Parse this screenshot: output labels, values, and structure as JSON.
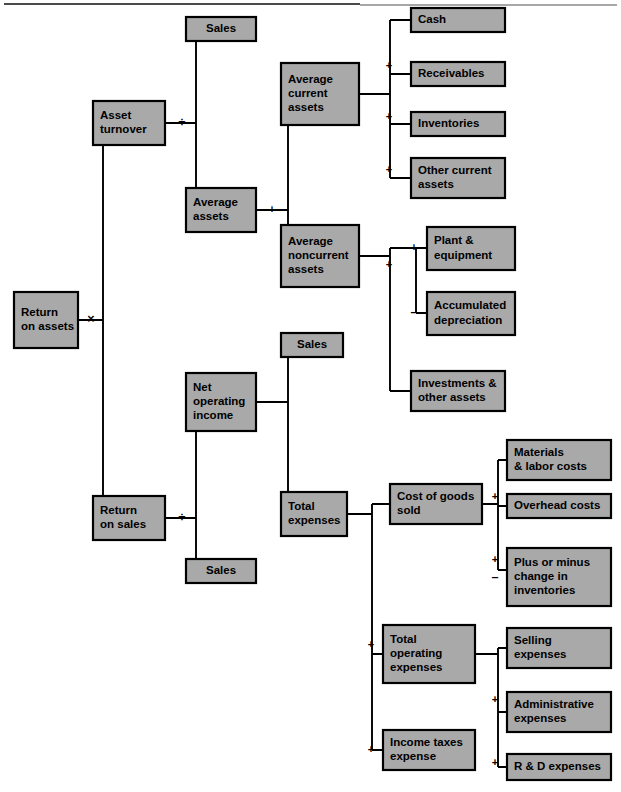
{
  "page": {
    "width": 621,
    "height": 792,
    "background_color": "#ffffff",
    "node_fill_color": "#a9a9a9",
    "node_border_color": "#000000",
    "connector_color": "#000000",
    "top_rule_color": "#8a8a8a"
  },
  "diagram": {
    "type": "tree",
    "root": "Return on assets",
    "nodes": [
      {
        "id": "return-on-assets",
        "label": "Return\non assets",
        "x": 14,
        "y": 292,
        "w": 64,
        "h": 56,
        "align": "left"
      },
      {
        "id": "asset-turnover",
        "label": "Asset\nturnover",
        "x": 93,
        "y": 101,
        "w": 72,
        "h": 44,
        "align": "left"
      },
      {
        "id": "return-on-sales",
        "label": "Return\non sales",
        "x": 93,
        "y": 496,
        "w": 72,
        "h": 44,
        "align": "left"
      },
      {
        "id": "sales-top",
        "label": "Sales",
        "x": 186,
        "y": 17,
        "w": 70,
        "h": 24,
        "align": "center"
      },
      {
        "id": "average-assets",
        "label": "Average\nassets",
        "x": 186,
        "y": 188,
        "w": 70,
        "h": 44,
        "align": "left"
      },
      {
        "id": "net-operating-income",
        "label": "Net\noperating\nincome",
        "x": 186,
        "y": 373,
        "w": 70,
        "h": 58,
        "align": "left"
      },
      {
        "id": "sales-bottom",
        "label": "Sales",
        "x": 186,
        "y": 559,
        "w": 70,
        "h": 24,
        "align": "center"
      },
      {
        "id": "average-current-assets",
        "label": "Average\ncurrent\nassets",
        "x": 281,
        "y": 63,
        "w": 78,
        "h": 62,
        "align": "left"
      },
      {
        "id": "average-noncurrent-assets",
        "label": "Average\nnoncurrent\nassets",
        "x": 281,
        "y": 225,
        "w": 78,
        "h": 62,
        "align": "left"
      },
      {
        "id": "sales-mid",
        "label": "Sales",
        "x": 281,
        "y": 333,
        "w": 62,
        "h": 24,
        "align": "center"
      },
      {
        "id": "total-expenses",
        "label": "Total\nexpenses",
        "x": 281,
        "y": 492,
        "w": 66,
        "h": 44,
        "align": "left"
      },
      {
        "id": "cash",
        "label": "Cash",
        "x": 411,
        "y": 8,
        "w": 94,
        "h": 24,
        "align": "left"
      },
      {
        "id": "receivables",
        "label": "Receivables",
        "x": 411,
        "y": 62,
        "w": 94,
        "h": 24,
        "align": "left"
      },
      {
        "id": "inventories",
        "label": "Inventories",
        "x": 411,
        "y": 112,
        "w": 94,
        "h": 24,
        "align": "left"
      },
      {
        "id": "other-current-assets",
        "label": "Other current\nassets",
        "x": 411,
        "y": 158,
        "w": 94,
        "h": 40,
        "align": "left"
      },
      {
        "id": "plant-equipment",
        "label": "Plant &\nequipment",
        "x": 427,
        "y": 227,
        "w": 88,
        "h": 43,
        "align": "left"
      },
      {
        "id": "accumulated-depreciation",
        "label": "Accumulated\ndepreciation",
        "x": 427,
        "y": 292,
        "w": 88,
        "h": 43,
        "align": "left"
      },
      {
        "id": "investments-other-assets",
        "label": "Investments &\nother assets",
        "x": 411,
        "y": 371,
        "w": 94,
        "h": 40,
        "align": "left"
      },
      {
        "id": "cost-of-goods-sold",
        "label": "Cost of goods\nsold",
        "x": 390,
        "y": 484,
        "w": 92,
        "h": 40,
        "align": "left"
      },
      {
        "id": "total-operating-expenses",
        "label": "Total\noperating\nexpenses",
        "x": 383,
        "y": 625,
        "w": 92,
        "h": 58,
        "align": "left"
      },
      {
        "id": "income-taxes-expense",
        "label": "Income taxes\nexpense",
        "x": 383,
        "y": 730,
        "w": 92,
        "h": 40,
        "align": "left"
      },
      {
        "id": "materials-labor-costs",
        "label": "Materials\n& labor costs",
        "x": 507,
        "y": 440,
        "w": 104,
        "h": 40,
        "align": "left"
      },
      {
        "id": "overhead-costs",
        "label": "Overhead costs",
        "x": 507,
        "y": 494,
        "w": 104,
        "h": 24,
        "align": "left"
      },
      {
        "id": "plus-or-minus-change",
        "label": "Plus or minus\nchange in\ninventories",
        "x": 507,
        "y": 548,
        "w": 104,
        "h": 58,
        "align": "left"
      },
      {
        "id": "selling-expenses",
        "label": "Selling\nexpenses",
        "x": 507,
        "y": 628,
        "w": 104,
        "h": 40,
        "align": "left"
      },
      {
        "id": "administrative-expenses",
        "label": "Administrative\nexpenses",
        "x": 507,
        "y": 692,
        "w": 104,
        "h": 40,
        "align": "left"
      },
      {
        "id": "r-and-d-expenses",
        "label": "R & D expenses",
        "x": 507,
        "y": 754,
        "w": 104,
        "h": 26,
        "align": "left"
      }
    ],
    "operators": [
      {
        "id": "op-multiply-roa",
        "symbol": "×",
        "x": 91,
        "y": 320,
        "size": "big"
      },
      {
        "id": "op-divide-asset-turn",
        "symbol": "÷",
        "x": 182,
        "y": 123,
        "size": "big"
      },
      {
        "id": "op-divide-ros",
        "symbol": "÷",
        "x": 182,
        "y": 518,
        "size": "big"
      },
      {
        "id": "op-plus-avg-assets",
        "symbol": "+",
        "x": 272,
        "y": 210,
        "size": "small"
      },
      {
        "id": "op-minus-noi",
        "symbol": "–",
        "x": 272,
        "y": 402,
        "size": "big"
      },
      {
        "id": "op-plus-cash-recv",
        "symbol": "+",
        "x": 389,
        "y": 66,
        "size": "small"
      },
      {
        "id": "op-plus-recv-inv",
        "symbol": "+",
        "x": 389,
        "y": 117,
        "size": "small"
      },
      {
        "id": "op-plus-inv-other",
        "symbol": "+",
        "x": 389,
        "y": 170,
        "size": "small"
      },
      {
        "id": "op-plus-plant",
        "symbol": "+",
        "x": 414,
        "y": 248,
        "size": "small"
      },
      {
        "id": "op-minus-accum-depr",
        "symbol": "–",
        "x": 414,
        "y": 313,
        "size": "big"
      },
      {
        "id": "op-plus-investments",
        "symbol": "+",
        "x": 389,
        "y": 265,
        "size": "small"
      },
      {
        "id": "op-plus-overhead",
        "symbol": "+",
        "x": 495,
        "y": 497,
        "size": "small"
      },
      {
        "id": "op-plus-change-inv",
        "symbol": "+",
        "x": 495,
        "y": 560,
        "size": "small"
      },
      {
        "id": "op-minus-change-inv",
        "symbol": "–",
        "x": 495,
        "y": 578,
        "size": "big"
      },
      {
        "id": "op-plus-total-oper-exp",
        "symbol": "+",
        "x": 371,
        "y": 645,
        "size": "small"
      },
      {
        "id": "op-plus-income-taxes",
        "symbol": "+",
        "x": 371,
        "y": 750,
        "size": "small"
      },
      {
        "id": "op-plus-admin-exp",
        "symbol": "+",
        "x": 495,
        "y": 700,
        "size": "small"
      },
      {
        "id": "op-plus-rnd-exp",
        "symbol": "+",
        "x": 495,
        "y": 763,
        "size": "small"
      }
    ],
    "connectors": [
      {
        "id": "conn-roa-split",
        "d": "M 78 320 L 103 320 M 103 320 L 103 123 M 103 320 L 103 518 M 103 123 L 93 123 M 103 518 L 93 518"
      },
      {
        "id": "conn-asset-turnover",
        "d": "M 165 123 L 196 123 M 196 123 L 196 29 M 196 123 L 196 210 M 196 29 L 186 29 M 196 210 L 186 210"
      },
      {
        "id": "conn-ros",
        "d": "M 165 518 L 196 518 M 196 518 L 196 402 M 196 518 L 196 571 M 196 402 L 186 402 M 196 571 L 186 571"
      },
      {
        "id": "conn-avg-assets",
        "d": "M 256 210 L 288 210 M 288 210 L 288 94 M 288 210 L 288 256 M 288 94 L 281 94 M 288 256 L 281 256"
      },
      {
        "id": "conn-noi",
        "d": "M 256 402 L 288 402 M 288 402 L 288 345 M 288 402 L 288 514 M 288 345 L 281 345 M 288 514 L 281 514"
      },
      {
        "id": "conn-avg-current",
        "d": "M 359 94 L 390 94 M 390 94 L 390 20 M 390 94 L 390 178 M 390 20 L 411 20 M 390 74 L 411 74 M 390 124 L 411 124 M 390 178 L 411 178"
      },
      {
        "id": "conn-avg-noncurrent",
        "d": "M 359 256 L 390 256 M 390 256 L 390 248 M 390 256 L 390 391 M 390 391 L 411 391 M 390 248 L 416 248 M 416 248 L 416 313 M 416 248 L 427 248 M 416 313 L 427 313"
      },
      {
        "id": "conn-total-expenses",
        "d": "M 347 514 L 372 514 M 372 514 L 372 504 M 372 514 L 372 654 M 372 654 L 372 750 M 372 504 L 390 504 M 372 654 L 383 654 M 372 750 L 383 750"
      },
      {
        "id": "conn-cogs",
        "d": "M 482 504 L 498 504 M 498 504 L 498 460 M 498 504 L 498 570 M 498 460 L 507 460 M 498 506 L 507 506 M 498 570 L 507 570"
      },
      {
        "id": "conn-total-oper-exp",
        "d": "M 475 654 L 498 654 M 498 654 L 498 648 M 498 654 L 498 767 M 498 648 L 507 648 M 498 712 L 507 712 M 498 767 L 507 767"
      }
    ]
  }
}
